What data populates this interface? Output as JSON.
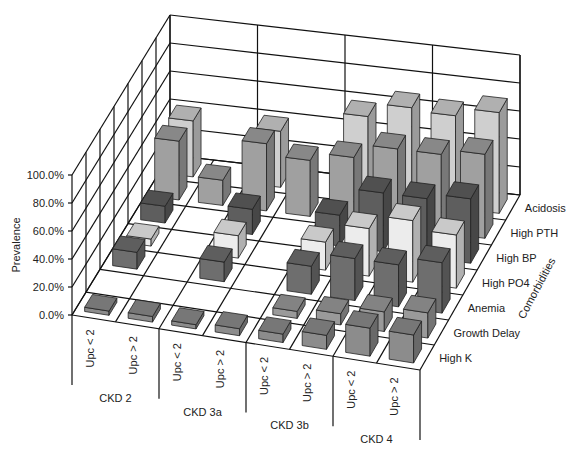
{
  "chart_data": {
    "type": "bar3d",
    "title": "",
    "ylabel": "Prevalence",
    "zlabel": "Comorbidities",
    "ylim": [
      0,
      100
    ],
    "y_ticks": [
      "0.0%",
      "20.0%",
      "40.0%",
      "60.0%",
      "80.0%",
      "100.0%"
    ],
    "groups": [
      "CKD 2",
      "CKD 3a",
      "CKD 3b",
      "CKD 4"
    ],
    "categories": [
      "Upc < 2",
      "Upc > 2",
      "Upc < 2",
      "Upc > 2",
      "Upc < 2",
      "Upc > 2",
      "Upc < 2",
      "Upc > 2"
    ],
    "series": [
      {
        "name": "High K",
        "color": "#8c8c8c",
        "values": [
          3,
          4,
          3,
          5,
          6,
          10,
          20,
          20
        ]
      },
      {
        "name": "Growth Delay",
        "color": "#9a9a9a",
        "values": [
          0,
          0,
          0,
          0,
          5,
          8,
          14,
          18
        ]
      },
      {
        "name": "Anemia",
        "color": "#6e6e6e",
        "values": [
          12,
          0,
          14,
          0,
          20,
          30,
          30,
          36
        ]
      },
      {
        "name": "High PO4",
        "color": "#ececec",
        "values": [
          5,
          0,
          16,
          0,
          20,
          34,
          44,
          38
        ]
      },
      {
        "name": "High BP",
        "color": "#5e5e5e",
        "values": [
          12,
          0,
          18,
          0,
          22,
          42,
          42,
          46
        ]
      },
      {
        "name": "High PTH",
        "color": "#a0a0a0",
        "values": [
          42,
          18,
          48,
          40,
          46,
          56,
          56,
          60
        ]
      },
      {
        "name": "Acidosis",
        "color": "#cfcfcf",
        "values": [
          40,
          0,
          40,
          0,
          58,
          68,
          66,
          72
        ]
      }
    ]
  }
}
